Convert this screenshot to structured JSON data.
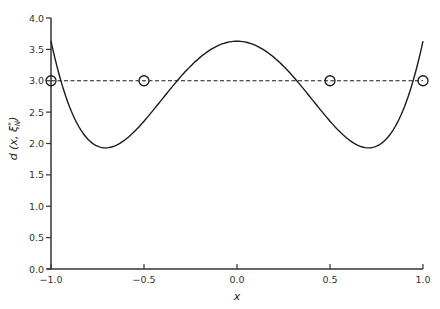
{
  "chart_data": {
    "type": "line",
    "title": "",
    "xlabel": "x",
    "ylabel": "d (x, ξ*N)",
    "ylabel_parts": {
      "main": "d (x,",
      "xi": "ξ",
      "sup": "*",
      "sub": "N",
      "close": ")"
    },
    "xlim": [
      -1.0,
      1.0
    ],
    "ylim": [
      0.0,
      4.0
    ],
    "xticks": [
      -1.0,
      -0.5,
      0.0,
      0.5,
      1.0
    ],
    "xtick_labels": [
      "-1.0",
      "-0.5",
      "0.0",
      "0.5",
      "1.0"
    ],
    "yticks": [
      0.0,
      0.5,
      1.0,
      1.5,
      2.0,
      2.5,
      3.0,
      3.5,
      4.0
    ],
    "ytick_labels": [
      "0.0",
      "0.5",
      "1.0",
      "1.5",
      "2.0",
      "2.5",
      "3.0",
      "3.5",
      "4.0"
    ],
    "grid": false,
    "legend": null,
    "series": [
      {
        "name": "variance function d(x, ξ*N)",
        "style": "solid",
        "model": {
          "form": "a + b*x^2 + c*x^4",
          "a": 3.63,
          "b": -6.8,
          "c": 6.8
        },
        "x": [
          -1.0,
          -0.9,
          -0.8,
          -0.71,
          -0.6,
          -0.5,
          -0.4,
          -0.3,
          -0.2,
          -0.1,
          0.0,
          0.1,
          0.2,
          0.3,
          0.4,
          0.5,
          0.6,
          0.71,
          0.8,
          0.9,
          1.0
        ],
        "values": [
          3.63,
          2.56,
          2.07,
          1.93,
          2.08,
          2.36,
          2.71,
          3.07,
          3.37,
          3.56,
          3.63,
          3.56,
          3.37,
          3.07,
          2.71,
          2.36,
          2.08,
          1.93,
          2.07,
          2.56,
          3.63
        ]
      },
      {
        "name": "reference level",
        "style": "dashed",
        "x": [
          -1.0,
          1.0
        ],
        "values": [
          3.0,
          3.0
        ]
      },
      {
        "name": "design points",
        "style": "open-circle markers",
        "x": [
          -1.0,
          -0.5,
          0.5,
          1.0
        ],
        "values": [
          3.0,
          3.0,
          3.0,
          3.0
        ]
      }
    ],
    "annotations": []
  },
  "colors": {
    "line": "#1a1a1a",
    "axis": "#333333",
    "background": "#ffffff"
  }
}
